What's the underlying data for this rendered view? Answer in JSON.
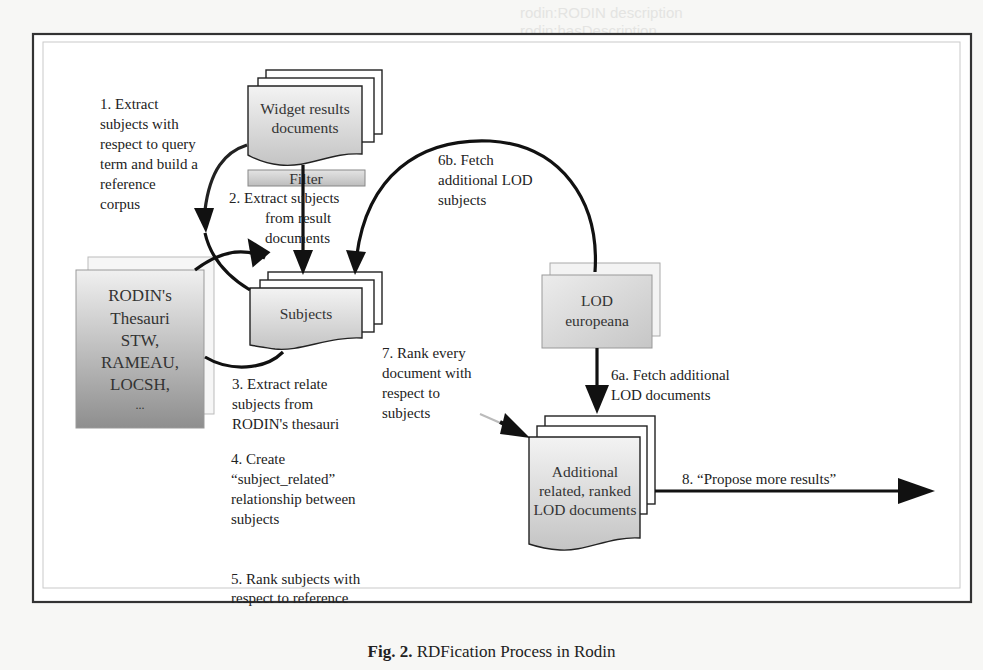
{
  "diagram": {
    "nodes": {
      "widget_results": "Widget results documents",
      "widget_results_lines": [
        "Widget results",
        "documents"
      ],
      "filter": "Filter",
      "subjects": "Subjects",
      "thesauri_lines": [
        "RODIN's",
        "Thesauri",
        "STW,",
        "RAMEAU,",
        "LOCSH,",
        "..."
      ],
      "lod_lines": [
        "LOD",
        "europeana"
      ],
      "additional_lines": [
        "Additional",
        "related, ranked",
        "LOD documents"
      ]
    },
    "steps": {
      "s1": [
        "1. Extract",
        "subjects with",
        "respect to query",
        "term and build a",
        "reference",
        "corpus"
      ],
      "s2": [
        "2. Extract subjects",
        "from result",
        "documents"
      ],
      "s3": [
        "3. Extract relate",
        "subjects from",
        "RODIN's thesauri"
      ],
      "s4": [
        "4. Create",
        "“subject_related”",
        "relationship between",
        "subjects"
      ],
      "s5": [
        "5. Rank subjects with",
        "respect to reference",
        "corpus"
      ],
      "s6a": [
        "6a. Fetch additional",
        "LOD documents"
      ],
      "s6b": [
        "6b. Fetch",
        "additional LOD",
        "subjects"
      ],
      "s7": [
        "7. Rank every",
        "document with",
        "respect to",
        "subjects"
      ],
      "s8": "8. “Propose more results”"
    },
    "colors": {
      "box_fill_top": "#f2f2f2",
      "box_fill_bottom": "#bdbdbd",
      "line": "#111111"
    }
  },
  "caption": {
    "label": "Fig. 2.",
    "text": "RDFication Process in Rodin"
  },
  "ghost_text": [
    "rodin:RODIN description",
    "rodin:hasDescription",
    "RDFication:hasSubject",
    "rodin:subjectRelated",
    "rodin:isRelatedTo",
    "dc:subject",
    "rodin:europeana",
    "rodin:hasDocument",
    "Dbpedia:Document"
  ]
}
